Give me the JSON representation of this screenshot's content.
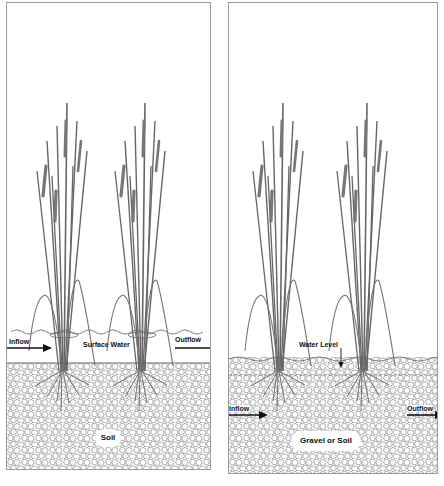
{
  "diagram": {
    "type": "constructed-wetland-comparison",
    "panels": [
      {
        "id": "left",
        "name": "surface-flow-wetland",
        "labels": {
          "inflow": "Inflow",
          "outflow": "Outflow",
          "water": "Surface Water",
          "substrate": "Soil"
        },
        "plants": 2
      },
      {
        "id": "right",
        "name": "subsurface-flow-wetland",
        "labels": {
          "inflow": "Inflow",
          "outflow": "Outflow",
          "water": "Water Level",
          "substrate": "Gravel or Soil"
        },
        "plants": 2
      }
    ],
    "colors": {
      "line": "#555555",
      "arrow": "#111111",
      "border": "#9a9a9a",
      "background": "#ffffff"
    }
  }
}
